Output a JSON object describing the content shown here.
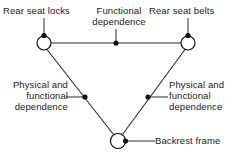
{
  "diagram": {
    "background_color": "#ffffff",
    "line_color": "#2b2b2b",
    "nodes": [
      {
        "id": "rear-seat-locks",
        "label": "Rear seat locks",
        "cx": 44,
        "cy": 43,
        "r": 7
      },
      {
        "id": "rear-seat-belts",
        "label": "Rear seat belts",
        "cx": 188,
        "cy": 43,
        "r": 7
      },
      {
        "id": "backrest-frame",
        "label": "Backrest frame",
        "cx": 118,
        "cy": 141,
        "r": 7.5
      }
    ],
    "edges": [
      {
        "id": "locks-belts",
        "from": "rear-seat-locks",
        "to": "rear-seat-belts",
        "label": "Functional dependence"
      },
      {
        "id": "locks-backrest",
        "from": "rear-seat-locks",
        "to": "backrest-frame",
        "label": "Physical and functional dependence"
      },
      {
        "id": "belts-backrest",
        "from": "rear-seat-belts",
        "to": "backrest-frame",
        "label": "Physical and functional dependence"
      }
    ],
    "labels": {
      "rear_seat_locks": "Rear seat locks",
      "rear_seat_belts": "Rear seat belts",
      "backrest_frame": "Backrest frame",
      "functional_dependence": {
        "line1": "Functional",
        "line2": "dependence"
      },
      "left_dependence": {
        "line1": "Physical and",
        "line2": "functional",
        "line3": "dependence"
      },
      "right_dependence": {
        "line1": "Physical and",
        "line2": "functional",
        "line3": "dependence"
      }
    }
  }
}
